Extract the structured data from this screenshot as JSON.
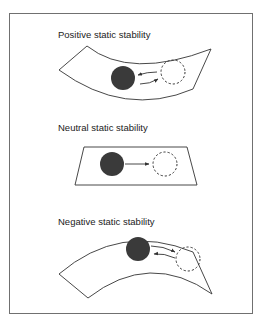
{
  "figure": {
    "background": "#ffffff",
    "frame_color": "#707070",
    "line_color": "#333333",
    "ball_fill": "#3a3a3a",
    "panels": [
      {
        "id": "positive",
        "label": "Positive static stability",
        "surface": "concave (valley)",
        "ball": "displaced ball returns to equilibrium",
        "arrows": [
          "displacement away",
          "restoring back"
        ]
      },
      {
        "id": "neutral",
        "label": "Neutral static stability",
        "surface": "flat",
        "ball": "displaced ball stays in new position",
        "arrows": [
          "displacement"
        ]
      },
      {
        "id": "negative",
        "label": "Negative static stability",
        "surface": "convex (hill)",
        "ball": "displaced ball continues away",
        "arrows": [
          "displacement away",
          "return"
        ]
      }
    ]
  }
}
